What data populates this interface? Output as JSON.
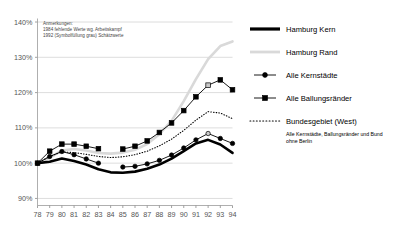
{
  "chart_data": {
    "type": "line",
    "title": "",
    "xlabel": "",
    "ylabel": "",
    "x": [
      78,
      79,
      80,
      81,
      82,
      83,
      84,
      85,
      86,
      87,
      88,
      89,
      90,
      91,
      92,
      93,
      94
    ],
    "xtick_labels": [
      "78",
      "79",
      "80",
      "81",
      "82",
      "83",
      "84",
      "85",
      "86",
      "87",
      "88",
      "89",
      "90",
      "91",
      "92",
      "93",
      "94"
    ],
    "ytick_labels": [
      "90%",
      "100%",
      "110%",
      "120%",
      "130%",
      "140%"
    ],
    "ytick_values": [
      90,
      100,
      110,
      120,
      130,
      140
    ],
    "ylim": [
      88,
      141
    ],
    "grid": "horizontal",
    "legend_position": "right",
    "series": [
      {
        "name": "Hamburg Kern",
        "style": "thick-black-line",
        "color": "#000000",
        "marker": "none",
        "values": [
          100.0,
          100.4,
          101.3,
          100.6,
          99.6,
          98.3,
          97.4,
          97.3,
          97.6,
          98.4,
          99.6,
          101.3,
          103.4,
          105.6,
          106.6,
          105.3,
          102.9
        ]
      },
      {
        "name": "Hamburg Rand",
        "style": "thick-gray-line",
        "color": "#d9d9d9",
        "marker": "none",
        "values": [
          100.0,
          101.5,
          103.6,
          104.0,
          103.6,
          102.9,
          102.7,
          103.0,
          103.8,
          105.4,
          108.2,
          112.0,
          117.6,
          123.8,
          129.5,
          133.2,
          134.5
        ]
      },
      {
        "name": "Alle Kernstädte",
        "style": "line-with-circle-markers",
        "color": "#000000",
        "marker": "circle",
        "values": [
          100.0,
          101.9,
          103.3,
          102.4,
          101.2,
          100.0,
          null,
          98.9,
          99.1,
          99.8,
          100.8,
          102.3,
          104.3,
          106.6,
          108.4,
          107.0,
          105.6
        ],
        "estimated_years": [
          92
        ]
      },
      {
        "name": "Alle Ballungsränder",
        "style": "line-with-square-markers",
        "color": "#000000",
        "marker": "square",
        "values": [
          100.0,
          103.4,
          105.4,
          105.4,
          104.8,
          104.1,
          null,
          104.0,
          104.8,
          106.3,
          108.7,
          111.4,
          114.9,
          118.8,
          122.1,
          123.6,
          120.8
        ],
        "estimated_years": [
          92
        ]
      },
      {
        "name": "Bundesgebiet (West)",
        "style": "dotted-line",
        "color": "#000000",
        "marker": "none",
        "values": [
          100.0,
          101.9,
          103.2,
          103.0,
          102.5,
          101.9,
          101.6,
          101.8,
          102.4,
          103.4,
          104.9,
          106.8,
          109.3,
          112.2,
          114.6,
          114.2,
          112.6
        ]
      }
    ],
    "annotation": {
      "lines": [
        "Anmerkungen:",
        "1984 fehlende Werte wg. Arbeitskampf",
        "1992 (Symbolfüllung grau) Schätzwerte"
      ]
    },
    "footnote": {
      "lines": [
        "Alle Kernstädte, Ballungsränder und Bund",
        "ohne Berlin"
      ]
    }
  }
}
